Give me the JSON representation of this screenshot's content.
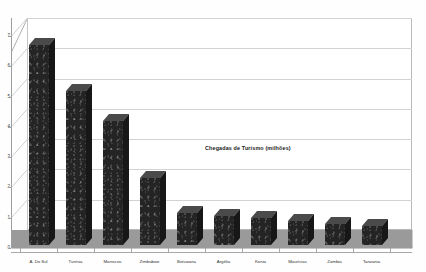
{
  "chart_data": {
    "type": "bar",
    "title": "Chegadas de Turismo  (milhões)",
    "xlabel": "",
    "ylabel": "",
    "ylim": [
      0,
      7
    ],
    "yticks": [
      0,
      1,
      2,
      3,
      4,
      5,
      6,
      7
    ],
    "ytick_labels": [
      "0",
      "1",
      "2",
      "3",
      "4",
      "5",
      "6",
      "7"
    ],
    "grid": true,
    "legend": "none",
    "style": "3d-column",
    "bar_color": "#242424",
    "floor_color": "#9a9a9a",
    "gridline_color": "#d2d2d2",
    "categories": [
      "Á. Do Sul",
      "Tunísia",
      "Marrocos",
      "Zimbabwe",
      "Botswana",
      "Argélia",
      "Kenia",
      "Maurícias",
      "Zambia",
      "Tanzania"
    ],
    "values": [
      6.6,
      5.1,
      4.1,
      2.2,
      1.05,
      0.95,
      0.9,
      0.8,
      0.7,
      0.62
    ],
    "units": "milhões"
  },
  "axis": {
    "y_title": "",
    "zero_label": "0"
  }
}
